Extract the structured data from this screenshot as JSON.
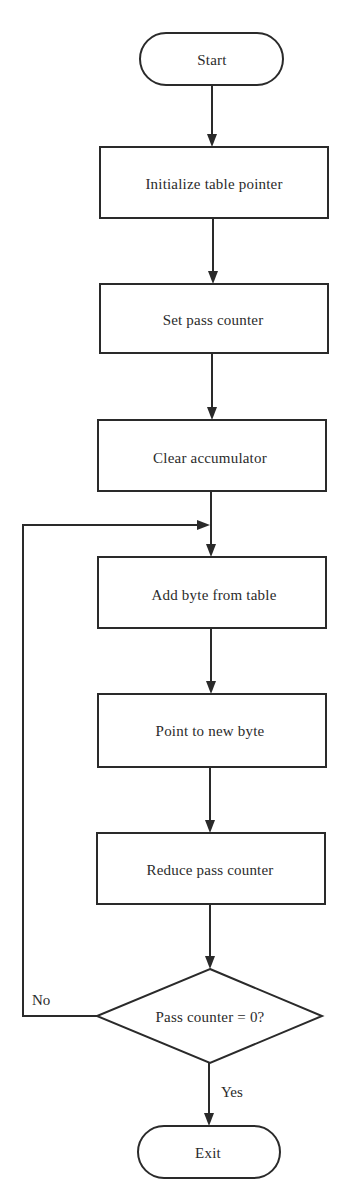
{
  "diagram": {
    "type": "flowchart",
    "colors": {
      "stroke": "#2a2a2a",
      "text": "#2b2b2b",
      "background": "#ffffff"
    },
    "nodes": [
      {
        "id": "start",
        "shape": "terminal",
        "label": "Start"
      },
      {
        "id": "init_pointer",
        "shape": "process",
        "label": "Initialize table pointer"
      },
      {
        "id": "set_counter",
        "shape": "process",
        "label": "Set pass counter"
      },
      {
        "id": "clear_acc",
        "shape": "process",
        "label": "Clear accumulator"
      },
      {
        "id": "add_byte",
        "shape": "process",
        "label": "Add byte from table"
      },
      {
        "id": "point_new",
        "shape": "process",
        "label": "Point to new byte"
      },
      {
        "id": "reduce_counter",
        "shape": "process",
        "label": "Reduce pass counter"
      },
      {
        "id": "decision",
        "shape": "decision",
        "label": "Pass counter = 0?"
      },
      {
        "id": "exit",
        "shape": "terminal",
        "label": "Exit"
      }
    ],
    "edges": [
      {
        "from": "start",
        "to": "init_pointer",
        "label": ""
      },
      {
        "from": "init_pointer",
        "to": "set_counter",
        "label": ""
      },
      {
        "from": "set_counter",
        "to": "clear_acc",
        "label": ""
      },
      {
        "from": "clear_acc",
        "to": "add_byte",
        "label": ""
      },
      {
        "from": "add_byte",
        "to": "point_new",
        "label": ""
      },
      {
        "from": "point_new",
        "to": "reduce_counter",
        "label": ""
      },
      {
        "from": "reduce_counter",
        "to": "decision",
        "label": ""
      },
      {
        "from": "decision",
        "to": "add_byte",
        "label": "No"
      },
      {
        "from": "decision",
        "to": "exit",
        "label": "Yes"
      }
    ],
    "branch_labels": {
      "no": "No",
      "yes": "Yes"
    }
  }
}
